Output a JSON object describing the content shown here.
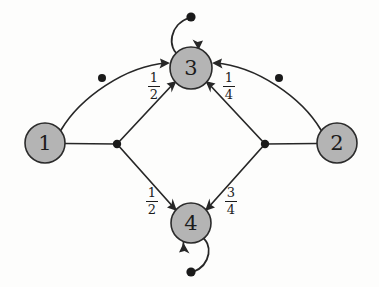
{
  "diagram": {
    "type": "state-transition-graph",
    "background_color": "#fdfdfc",
    "node_fill_color": "#b4b4b4",
    "node_stroke_color": "#2b2b2b",
    "edge_color": "#272727",
    "nodes": [
      {
        "id": "1",
        "label": "1",
        "cx": 45,
        "cy": 143,
        "r": 20
      },
      {
        "id": "2",
        "label": "2",
        "cx": 337,
        "cy": 143,
        "r": 20
      },
      {
        "id": "3",
        "label": "3",
        "cx": 191,
        "cy": 68,
        "r": 21
      },
      {
        "id": "4",
        "label": "4",
        "cx": 191,
        "cy": 223,
        "r": 20
      }
    ],
    "junctions": [
      {
        "id": "left-junction",
        "cx": 117,
        "cy": 144
      },
      {
        "id": "right-junction",
        "cx": 265,
        "cy": 144
      },
      {
        "id": "left-arc-dot",
        "cx": 102,
        "cy": 78
      },
      {
        "id": "right-arc-dot",
        "cx": 279,
        "cy": 78
      }
    ],
    "edges": [
      {
        "id": "edge-1-3-arc",
        "from": "1",
        "to": "3",
        "label": "",
        "arrow": "into-3"
      },
      {
        "id": "edge-2-3-arc",
        "from": "2",
        "to": "3",
        "label": "",
        "arrow": "into-3"
      },
      {
        "id": "edge-1-junction",
        "from": "1",
        "to": "left-junction",
        "label": "",
        "arrow": "none"
      },
      {
        "id": "edge-2-junction",
        "from": "2",
        "to": "right-junction",
        "label": "",
        "arrow": "none"
      },
      {
        "id": "edge-left-3",
        "from": "left-junction",
        "to": "3",
        "label": "1/2",
        "numerator": "1",
        "denominator": "2",
        "arrow": "into-3"
      },
      {
        "id": "edge-right-3",
        "from": "right-junction",
        "to": "3",
        "label": "1/4",
        "numerator": "1",
        "denominator": "4",
        "arrow": "into-3"
      },
      {
        "id": "edge-left-4",
        "from": "left-junction",
        "to": "4",
        "label": "1/2",
        "numerator": "1",
        "denominator": "2",
        "arrow": "into-4"
      },
      {
        "id": "edge-right-4",
        "from": "right-junction",
        "to": "4",
        "label": "3/4",
        "numerator": "3",
        "denominator": "4",
        "arrow": "into-4"
      }
    ],
    "self_loops": [
      {
        "id": "loop-3",
        "node": "3",
        "position": "above",
        "label": "",
        "arrow": "into-3"
      },
      {
        "id": "loop-4",
        "node": "4",
        "position": "below",
        "label": "",
        "arrow": "into-4"
      }
    ],
    "labels": {
      "upper_left": {
        "numerator": "1",
        "denominator": "2"
      },
      "upper_right": {
        "numerator": "1",
        "denominator": "4"
      },
      "lower_left": {
        "numerator": "1",
        "denominator": "2"
      },
      "lower_right": {
        "numerator": "3",
        "denominator": "4"
      }
    }
  }
}
